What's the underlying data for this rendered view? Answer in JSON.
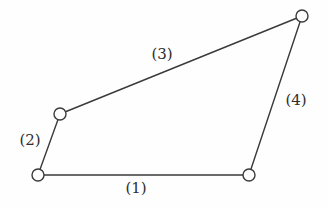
{
  "diagram": {
    "type": "four-bar-linkage",
    "colors": {
      "line": "#3a3a3a",
      "joint_fill": "#ffffff",
      "label": "#2e2e2e",
      "background": "#fefefe"
    },
    "joints": [
      {
        "id": "A",
        "x": 38,
        "y": 175
      },
      {
        "id": "B",
        "x": 60,
        "y": 114
      },
      {
        "id": "C",
        "x": 302,
        "y": 16
      },
      {
        "id": "D",
        "x": 249,
        "y": 175
      }
    ],
    "links": [
      {
        "id": "1",
        "label": "(1)",
        "from": "A",
        "to": "D",
        "label_x": 136,
        "label_y": 188
      },
      {
        "id": "2",
        "label": "(2)",
        "from": "A",
        "to": "B",
        "label_x": 30,
        "label_y": 140
      },
      {
        "id": "3",
        "label": "(3)",
        "from": "B",
        "to": "C",
        "label_x": 162,
        "label_y": 54
      },
      {
        "id": "4",
        "label": "(4)",
        "from": "D",
        "to": "C",
        "label_x": 296,
        "label_y": 100
      }
    ]
  }
}
